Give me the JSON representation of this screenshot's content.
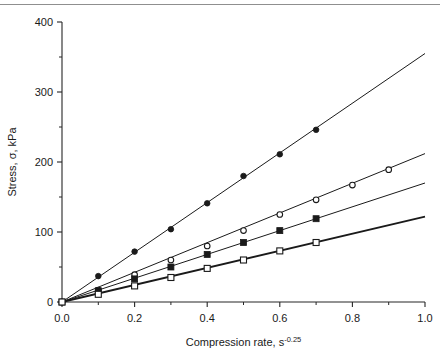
{
  "figure": {
    "top_rule_visible": true,
    "background_color": "#ffffff",
    "ink_color": "#1a1a1a"
  },
  "chart_data": {
    "type": "line",
    "title": "",
    "subtitle": "",
    "xlabel": "Compression rate, s",
    "xlabel_superscript": "-0.25",
    "xlabel_full": "Compression rate, s^-0.25",
    "ylabel": "Stress, σ, kPa",
    "xlim": [
      0.0,
      1.0
    ],
    "ylim": [
      0,
      400
    ],
    "xticks": [
      0.0,
      0.2,
      0.4,
      0.6,
      0.8,
      1.0
    ],
    "xtick_labels": [
      "0.0",
      "0.2",
      "0.4",
      "0.6",
      "0.8",
      "1.0"
    ],
    "xticks_minor": [
      0.1,
      0.3,
      0.5,
      0.7,
      0.9
    ],
    "yticks": [
      0,
      100,
      200,
      300,
      400
    ],
    "ytick_labels": [
      "0",
      "100",
      "200",
      "300",
      "400"
    ],
    "yticks_minor": [
      50,
      150,
      250,
      350
    ],
    "grid": false,
    "legend": false,
    "legend_position": "none",
    "annotations": [],
    "series": [
      {
        "name": "series-filled-circle",
        "marker": "filled-circle",
        "marker_size": 4.0,
        "line_width": 1.0,
        "slope": 355,
        "fit_x": [
          0.0,
          1.0
        ],
        "fit_y": [
          0,
          355
        ],
        "x": [
          0.0,
          0.1,
          0.2,
          0.3,
          0.4,
          0.5,
          0.6,
          0.7
        ],
        "y": [
          0,
          37,
          72,
          104,
          141,
          180,
          211,
          246
        ]
      },
      {
        "name": "series-open-circle",
        "marker": "open-circle",
        "marker_size": 4.0,
        "line_width": 1.0,
        "slope": 212,
        "fit_x": [
          0.0,
          1.0
        ],
        "fit_y": [
          0,
          212
        ],
        "x": [
          0.0,
          0.1,
          0.2,
          0.3,
          0.4,
          0.5,
          0.6,
          0.7,
          0.8,
          0.9
        ],
        "y": [
          0,
          17,
          39,
          60,
          80,
          102,
          125,
          146,
          167,
          189
        ]
      },
      {
        "name": "series-filled-square",
        "marker": "filled-square",
        "marker_size": 4.4,
        "line_width": 1.0,
        "slope": 170,
        "fit_x": [
          0.0,
          1.0
        ],
        "fit_y": [
          0,
          170
        ],
        "x": [
          0.0,
          0.1,
          0.2,
          0.3,
          0.4,
          0.5,
          0.6,
          0.7
        ],
        "y": [
          0,
          16,
          33,
          50,
          68,
          85,
          102,
          119
        ]
      },
      {
        "name": "series-open-square",
        "marker": "open-square",
        "marker_size": 4.4,
        "line_width": 1.8,
        "slope": 122,
        "fit_x": [
          0.0,
          1.0
        ],
        "fit_y": [
          0,
          122
        ],
        "x": [
          0.0,
          0.1,
          0.2,
          0.3,
          0.4,
          0.5,
          0.6,
          0.7
        ],
        "y": [
          0,
          11,
          23,
          35,
          48,
          60,
          73,
          85
        ]
      }
    ]
  }
}
